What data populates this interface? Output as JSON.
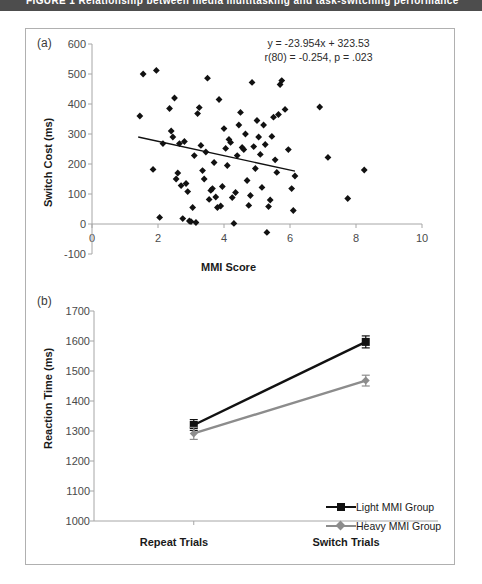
{
  "caption": {
    "text": "FIGURE 1  Relationship between media multitasking and task-switching performance"
  },
  "colors": {
    "axis": "#a6a6a6",
    "marker": "#111111",
    "light_group": "#111111",
    "heavy_group": "#8c8c8c",
    "frame": "#b0b0b0",
    "caption_bar": "#4d4d4d"
  },
  "panels": {
    "a": {
      "tag": "(a)"
    },
    "b": {
      "tag": "(b)"
    }
  },
  "chart_data": [
    {
      "type": "scatter",
      "panel": "(a)",
      "title": "",
      "xlabel": "MMI Score",
      "ylabel": "Switch Cost (ms)",
      "xlim": [
        0,
        10
      ],
      "ylim": [
        -100,
        600
      ],
      "xticks": [
        0,
        2,
        4,
        6,
        8,
        10
      ],
      "yticks": [
        -100,
        0,
        100,
        200,
        300,
        400,
        500,
        600
      ],
      "grid": false,
      "annotations": [
        "y = -23.954x + 323.53",
        "r(80) = -0.254, p = .023"
      ],
      "trendline": {
        "equation": "y = -23.954x + 323.53",
        "slope": -23.954,
        "intercept": 323.53,
        "x_start": 1.4,
        "x_end": 6.15
      },
      "correlation": {
        "r": -0.254,
        "df": 80,
        "p": 0.023
      },
      "points": [
        [
          1.55,
          500
        ],
        [
          1.45,
          360
        ],
        [
          1.95,
          512
        ],
        [
          1.85,
          182
        ],
        [
          2.05,
          22
        ],
        [
          2.15,
          268
        ],
        [
          2.35,
          385
        ],
        [
          2.4,
          310
        ],
        [
          2.45,
          290
        ],
        [
          2.5,
          420
        ],
        [
          2.55,
          150
        ],
        [
          2.6,
          170
        ],
        [
          2.65,
          268
        ],
        [
          2.7,
          128
        ],
        [
          2.75,
          18
        ],
        [
          2.8,
          275
        ],
        [
          2.85,
          135
        ],
        [
          2.9,
          108
        ],
        [
          2.95,
          10
        ],
        [
          3.0,
          8
        ],
        [
          3.05,
          55
        ],
        [
          3.1,
          228
        ],
        [
          3.15,
          5
        ],
        [
          3.2,
          368
        ],
        [
          3.25,
          388
        ],
        [
          3.3,
          262
        ],
        [
          3.35,
          178
        ],
        [
          3.4,
          150
        ],
        [
          3.45,
          240
        ],
        [
          3.5,
          486
        ],
        [
          3.55,
          82
        ],
        [
          3.6,
          112
        ],
        [
          3.65,
          118
        ],
        [
          3.7,
          205
        ],
        [
          3.75,
          90
        ],
        [
          3.8,
          55
        ],
        [
          3.85,
          415
        ],
        [
          3.9,
          60
        ],
        [
          3.95,
          125
        ],
        [
          4.0,
          318
        ],
        [
          4.05,
          252
        ],
        [
          4.1,
          195
        ],
        [
          4.15,
          282
        ],
        [
          4.2,
          272
        ],
        [
          4.25,
          88
        ],
        [
          4.3,
          2
        ],
        [
          4.35,
          105
        ],
        [
          4.4,
          228
        ],
        [
          4.45,
          330
        ],
        [
          4.5,
          372
        ],
        [
          4.55,
          255
        ],
        [
          4.6,
          248
        ],
        [
          4.65,
          300
        ],
        [
          4.7,
          145
        ],
        [
          4.75,
          62
        ],
        [
          4.8,
          95
        ],
        [
          4.85,
          472
        ],
        [
          4.9,
          258
        ],
        [
          4.95,
          185
        ],
        [
          5.0,
          345
        ],
        [
          5.05,
          290
        ],
        [
          5.1,
          232
        ],
        [
          5.15,
          122
        ],
        [
          5.2,
          330
        ],
        [
          5.25,
          265
        ],
        [
          5.3,
          -28
        ],
        [
          5.35,
          58
        ],
        [
          5.4,
          80
        ],
        [
          5.45,
          292
        ],
        [
          5.5,
          356
        ],
        [
          5.55,
          214
        ],
        [
          5.6,
          172
        ],
        [
          5.65,
          365
        ],
        [
          5.7,
          465
        ],
        [
          5.75,
          478
        ],
        [
          5.85,
          382
        ],
        [
          5.95,
          248
        ],
        [
          6.05,
          118
        ],
        [
          6.1,
          45
        ],
        [
          6.15,
          160
        ],
        [
          6.9,
          390
        ],
        [
          7.15,
          222
        ],
        [
          7.75,
          85
        ],
        [
          8.25,
          180
        ]
      ]
    },
    {
      "type": "line",
      "panel": "(b)",
      "title": "",
      "xlabel": "",
      "ylabel": "Reaction Time (ms)",
      "categories": [
        "Repeat Trials",
        "Switch Trials"
      ],
      "ylim": [
        1000,
        1700
      ],
      "yticks": [
        1000,
        1100,
        1200,
        1300,
        1400,
        1500,
        1600,
        1700
      ],
      "grid": false,
      "legend_position": "bottom-right",
      "series": [
        {
          "name": "Light MMI Group",
          "values": [
            1320,
            1597
          ],
          "errors": [
            18,
            20
          ],
          "color": "#111111",
          "marker": "square"
        },
        {
          "name": "Heavy MMI Group",
          "values": [
            1292,
            1468
          ],
          "errors": [
            20,
            18
          ],
          "color": "#8c8c8c",
          "marker": "diamond"
        }
      ]
    }
  ]
}
